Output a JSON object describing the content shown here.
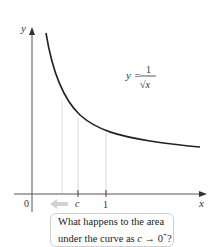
{
  "figure": {
    "axes": {
      "x_label": "x",
      "y_label": "y",
      "origin_label": "0",
      "ticks": [
        {
          "label": "c",
          "italic": true
        },
        {
          "label": "1",
          "italic": false
        }
      ]
    },
    "curve": {
      "equation_lhs": "y =",
      "equation_numerator": "1",
      "equation_denominator": "√x",
      "color": "#222222"
    },
    "arrow_hint": "left-arrow",
    "callout": {
      "line1": "What happens to the area",
      "line2_prefix": "under the curve as ",
      "line2_var": "c",
      "line2_suffix": " → 0",
      "line2_sup": "+",
      "line2_end": "?"
    },
    "colors": {
      "axis": "#555555",
      "curve": "#222222",
      "guide_lines": "#d8d8d8",
      "arrow": "#cccccc",
      "callout_border": "#cfcfcf"
    }
  }
}
